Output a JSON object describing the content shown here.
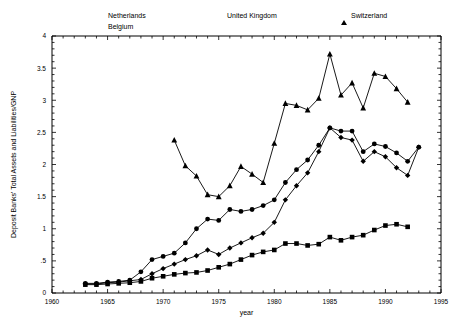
{
  "chart_data": {
    "type": "line",
    "title": "",
    "xlabel": "year",
    "ylabel": "Deposit Banks' Total Assets and Liabilities/GNP",
    "xlim": [
      1960,
      1995
    ],
    "ylim": [
      0,
      4
    ],
    "xticks": [
      1960,
      1965,
      1970,
      1975,
      1980,
      1985,
      1990,
      1995
    ],
    "xtick_labels": [
      "1960",
      "1965",
      "1970",
      "1975",
      "1980",
      "1985",
      "1990",
      "1995"
    ],
    "yticks": [
      0,
      0.5,
      1,
      1.5,
      2,
      2.5,
      3,
      3.5,
      4
    ],
    "ytick_labels": [
      "0",
      ".5",
      "1",
      "1.5",
      "2",
      "2.5",
      "3",
      "3.5",
      "4"
    ],
    "x_minor_step": 1,
    "y_minor_step": 0.1,
    "grid": false,
    "legend_position": "top",
    "series": [
      {
        "name": "Netherlands",
        "marker": "square",
        "x": [
          1963,
          1964,
          1965,
          1966,
          1967,
          1968,
          1969,
          1970,
          1971,
          1972,
          1973,
          1974,
          1975,
          1976,
          1977,
          1978,
          1979,
          1980,
          1981,
          1982,
          1983,
          1984,
          1985,
          1986,
          1987,
          1988,
          1989,
          1990,
          1991,
          1992
        ],
        "values": [
          0.13,
          0.13,
          0.14,
          0.15,
          0.16,
          0.18,
          0.23,
          0.26,
          0.29,
          0.31,
          0.32,
          0.35,
          0.4,
          0.45,
          0.52,
          0.59,
          0.64,
          0.67,
          0.77,
          0.77,
          0.74,
          0.76,
          0.87,
          0.82,
          0.87,
          0.9,
          0.98,
          1.05,
          1.07,
          1.03
        ]
      },
      {
        "name": "Belgium",
        "marker": "diamond",
        "x": [
          1963,
          1964,
          1965,
          1966,
          1967,
          1968,
          1969,
          1970,
          1971,
          1972,
          1973,
          1974,
          1975,
          1976,
          1977,
          1978,
          1979,
          1980,
          1981,
          1982,
          1983,
          1984,
          1985,
          1986,
          1987,
          1988,
          1989,
          1990,
          1991,
          1992,
          1993
        ],
        "values": [
          0.14,
          0.14,
          0.16,
          0.17,
          0.19,
          0.21,
          0.3,
          0.38,
          0.45,
          0.52,
          0.58,
          0.67,
          0.6,
          0.7,
          0.78,
          0.86,
          0.93,
          1.1,
          1.45,
          1.67,
          1.87,
          2.2,
          2.57,
          2.42,
          2.38,
          2.05,
          2.2,
          2.12,
          1.95,
          1.83,
          2.27
        ]
      },
      {
        "name": "United Kingdom",
        "marker": "circle",
        "x": [
          1963,
          1964,
          1965,
          1966,
          1967,
          1968,
          1969,
          1970,
          1971,
          1972,
          1973,
          1974,
          1975,
          1976,
          1977,
          1978,
          1979,
          1980,
          1981,
          1982,
          1983,
          1984,
          1985,
          1986,
          1987,
          1988,
          1989,
          1990,
          1991,
          1992,
          1993
        ],
        "values": [
          0.15,
          0.15,
          0.17,
          0.18,
          0.2,
          0.33,
          0.52,
          0.57,
          0.62,
          0.78,
          1.0,
          1.15,
          1.13,
          1.3,
          1.27,
          1.3,
          1.36,
          1.45,
          1.72,
          1.92,
          2.07,
          2.3,
          2.57,
          2.52,
          2.52,
          2.2,
          2.32,
          2.28,
          2.18,
          2.05,
          2.27
        ]
      },
      {
        "name": "Switzerland",
        "marker": "triangle",
        "x": [
          1971,
          1972,
          1973,
          1974,
          1975,
          1976,
          1977,
          1978,
          1979,
          1980,
          1981,
          1982,
          1983,
          1984,
          1985,
          1986,
          1987,
          1988,
          1989,
          1990,
          1991,
          1992
        ],
        "values": [
          2.38,
          1.98,
          1.82,
          1.53,
          1.5,
          1.67,
          1.97,
          1.85,
          1.72,
          2.33,
          2.95,
          2.92,
          2.85,
          3.03,
          3.72,
          3.08,
          3.27,
          2.88,
          3.42,
          3.37,
          3.18,
          2.97
        ]
      }
    ]
  },
  "legend": {
    "items": [
      {
        "label": "Netherlands",
        "marker": "square"
      },
      {
        "label": "United Kingdom",
        "marker": "circle"
      },
      {
        "label": "Switzerland",
        "marker": "triangle"
      },
      {
        "label": "Belgium",
        "marker": "diamond"
      }
    ]
  },
  "colors": {
    "ink": "#000000",
    "background": "#ffffff"
  }
}
